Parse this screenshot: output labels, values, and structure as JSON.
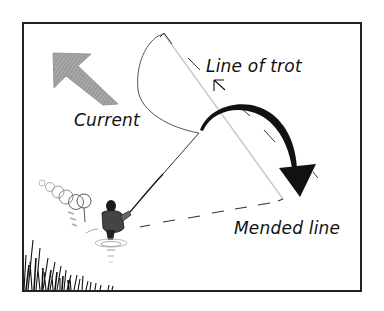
{
  "figure": {
    "labels": {
      "line_of_trot": "Line of trot",
      "current": "Current",
      "mended_line": "Mended line"
    },
    "colors": {
      "frame": "#222222",
      "ink": "#111111",
      "current_arrow": "#9a9a9a",
      "trot_line": "#c8c8c8",
      "background": "#ffffff"
    },
    "icons": {
      "current_arrow": "arrow-up-left-icon",
      "mend_arrow": "curved-arrow-icon",
      "small_arrow": "arrow-up-left-icon"
    }
  }
}
